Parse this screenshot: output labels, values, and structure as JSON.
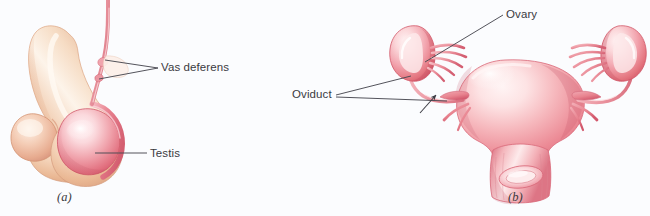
{
  "figure": {
    "background_color": "#fbfcfe",
    "label_color": "#3a3a3e",
    "leader_line_color": "#4a4a52",
    "panels": [
      {
        "id": "a",
        "caption": "(a)",
        "subject": "male reproductive organs",
        "labels": [
          {
            "name": "vas-deferens",
            "text": "Vas deferens"
          },
          {
            "name": "testis",
            "text": "Testis"
          }
        ]
      },
      {
        "id": "b",
        "caption": "(b)",
        "subject": "female reproductive organs",
        "labels": [
          {
            "name": "oviduct",
            "text": "Oviduct"
          },
          {
            "name": "ovary",
            "text": "Ovary"
          }
        ]
      }
    ]
  },
  "labels": {
    "vas_deferens": "Vas deferens",
    "testis": "Testis",
    "oviduct": "Oviduct",
    "ovary": "Ovary",
    "panel_a": "(a)",
    "panel_b": "(b)"
  },
  "colors": {
    "background": "#fbfcfe",
    "skin_light": "#f7e3d2",
    "skin_mid": "#eec4a6",
    "skin_shadow": "#d9a383",
    "tissue_light": "#fdeff0",
    "tissue_mid": "#f2a8ad",
    "tissue_deep": "#e4737f",
    "tissue_dark": "#cf4f60",
    "duct_pink": "#eb9aa4",
    "leader_line": "#4a4a52",
    "text": "#3a3a3e"
  }
}
